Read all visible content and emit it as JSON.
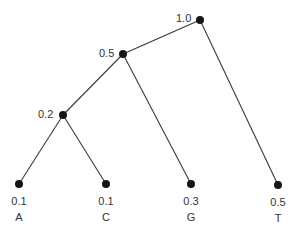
{
  "diagram": {
    "type": "binary-tree",
    "colors": {
      "edge": "#3a3a3a",
      "node": "#151515",
      "text": "#333333",
      "background": "#ffffff"
    },
    "nodes": [
      {
        "id": "root",
        "weight": "1.0",
        "x": 200,
        "y": 20,
        "leaf": false
      },
      {
        "id": "n05",
        "weight": "0.5",
        "x": 123,
        "y": 54,
        "leaf": false
      },
      {
        "id": "n02",
        "weight": "0.2",
        "x": 63,
        "y": 115,
        "leaf": false
      },
      {
        "id": "A",
        "weight": "0.1",
        "symbol": "A",
        "x": 19,
        "y": 184,
        "leaf": true
      },
      {
        "id": "C",
        "weight": "0.1",
        "symbol": "C",
        "x": 106,
        "y": 184,
        "leaf": true
      },
      {
        "id": "G",
        "weight": "0.3",
        "symbol": "G",
        "x": 191,
        "y": 184,
        "leaf": true
      },
      {
        "id": "T",
        "weight": "0.5",
        "symbol": "T",
        "x": 278,
        "y": 185,
        "leaf": true
      }
    ],
    "edges": [
      {
        "from": "root",
        "to": "n05"
      },
      {
        "from": "root",
        "to": "T"
      },
      {
        "from": "n05",
        "to": "n02"
      },
      {
        "from": "n05",
        "to": "G"
      },
      {
        "from": "n02",
        "to": "A"
      },
      {
        "from": "n02",
        "to": "C"
      }
    ],
    "labels": {
      "root": "1.0",
      "n05": "0.5",
      "n02": "0.2",
      "A_weight": "0.1",
      "A_symbol": "A",
      "C_weight": "0.1",
      "C_symbol": "C",
      "G_weight": "0.3",
      "G_symbol": "G",
      "T_weight": "0.5",
      "T_symbol": "T"
    }
  }
}
